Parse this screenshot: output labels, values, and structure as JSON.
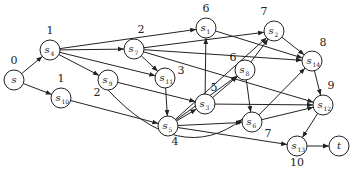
{
  "diagram": {
    "type": "directed-graph",
    "nodes": [
      {
        "id": "s",
        "base": "s",
        "sub": "",
        "x": 14,
        "y": 80,
        "level": "0",
        "lx": 14,
        "ly": 64
      },
      {
        "id": "s4",
        "base": "s",
        "sub": "4",
        "x": 50,
        "y": 50,
        "level": "1",
        "lx": 50,
        "ly": 34
      },
      {
        "id": "s10",
        "base": "s",
        "sub": "10",
        "x": 61,
        "y": 98,
        "level": "1",
        "lx": 61,
        "ly": 82
      },
      {
        "id": "s9",
        "base": "s",
        "sub": "9",
        "x": 108,
        "y": 80,
        "level": "2",
        "lx": 97,
        "ly": 96
      },
      {
        "id": "s7",
        "base": "s",
        "sub": "7",
        "x": 134,
        "y": 49,
        "level": "2",
        "lx": 141,
        "ly": 33
      },
      {
        "id": "s11",
        "base": "s",
        "sub": "11",
        "x": 165,
        "y": 78,
        "level": "3",
        "lx": 181,
        "ly": 74
      },
      {
        "id": "s1",
        "base": "s",
        "sub": "1",
        "x": 206,
        "y": 28,
        "level": "6",
        "lx": 206,
        "ly": 12
      },
      {
        "id": "s3",
        "base": "s",
        "sub": "3",
        "x": 205,
        "y": 104,
        "level": "5",
        "lx": 214,
        "ly": 91
      },
      {
        "id": "s5",
        "base": "s",
        "sub": "5",
        "x": 168,
        "y": 126,
        "level": "4",
        "lx": 175,
        "ly": 145
      },
      {
        "id": "s8",
        "base": "s",
        "sub": "8",
        "x": 245,
        "y": 70,
        "level": "6",
        "lx": 233,
        "ly": 61
      },
      {
        "id": "s2",
        "base": "s",
        "sub": "2",
        "x": 274,
        "y": 31,
        "level": "7",
        "lx": 264,
        "ly": 15
      },
      {
        "id": "s6",
        "base": "s",
        "sub": "6",
        "x": 252,
        "y": 122,
        "level": "7",
        "lx": 268,
        "ly": 137
      },
      {
        "id": "s14",
        "base": "s",
        "sub": "14",
        "x": 312,
        "y": 61,
        "level": "8",
        "lx": 323,
        "ly": 46
      },
      {
        "id": "s12",
        "base": "s",
        "sub": "12",
        "x": 323,
        "y": 105,
        "level": "9",
        "lx": 331,
        "ly": 89
      },
      {
        "id": "s13",
        "base": "s",
        "sub": "13",
        "x": 297,
        "y": 146,
        "level": "10",
        "lx": 297,
        "ly": 166
      },
      {
        "id": "t",
        "base": "t",
        "sub": "",
        "x": 339,
        "y": 146,
        "level": "",
        "lx": 0,
        "ly": 0
      }
    ],
    "edges": [
      {
        "from": "s",
        "to": "s4"
      },
      {
        "from": "s",
        "to": "s10"
      },
      {
        "from": "s4",
        "to": "s1"
      },
      {
        "from": "s4",
        "to": "s7"
      },
      {
        "from": "s4",
        "to": "s9"
      },
      {
        "from": "s4",
        "to": "s11"
      },
      {
        "from": "s10",
        "to": "s5"
      },
      {
        "from": "s7",
        "to": "s11"
      },
      {
        "from": "s7",
        "to": "s2"
      },
      {
        "from": "s7",
        "to": "s14"
      },
      {
        "from": "s7",
        "to": "s12"
      },
      {
        "from": "s9",
        "to": "s3"
      },
      {
        "from": "s9",
        "to": "s6",
        "curve": "down"
      },
      {
        "from": "s11",
        "to": "s5"
      },
      {
        "from": "s5",
        "to": "s3"
      },
      {
        "from": "s5",
        "to": "s8"
      },
      {
        "from": "s5",
        "to": "s2"
      },
      {
        "from": "s5",
        "to": "s6"
      },
      {
        "from": "s5",
        "to": "s13"
      },
      {
        "from": "s3",
        "to": "s1"
      },
      {
        "from": "s3",
        "to": "s8"
      },
      {
        "from": "s3",
        "to": "s12"
      },
      {
        "from": "s1",
        "to": "s14"
      },
      {
        "from": "s8",
        "to": "s2"
      },
      {
        "from": "s8",
        "to": "s6"
      },
      {
        "from": "s2",
        "to": "s14"
      },
      {
        "from": "s6",
        "to": "s14"
      },
      {
        "from": "s6",
        "to": "s12"
      },
      {
        "from": "s14",
        "to": "s12"
      },
      {
        "from": "s12",
        "to": "s13"
      },
      {
        "from": "s13",
        "to": "t"
      }
    ],
    "colors": {
      "stroke": "#222222",
      "fill": "#ffffff",
      "background": "#ffffff"
    }
  }
}
